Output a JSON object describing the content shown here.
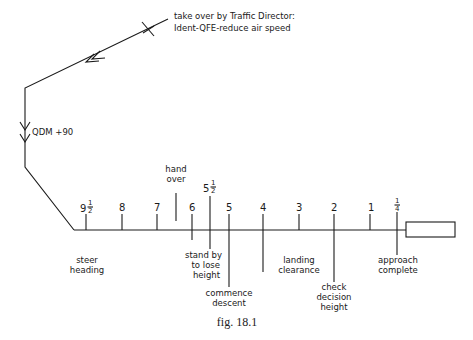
{
  "figure": {
    "caption": "fig. 18.1",
    "stroke_color": "#1a1a1a",
    "background": "#ffffff"
  },
  "path": {
    "takeover_note_line1": "take over by Traffic Director:",
    "takeover_note_line2": "Ident-QFE-reduce air speed",
    "heading_label": "QDM +90"
  },
  "ticks": [
    {
      "label": "9",
      "fraction": "1/2",
      "x": 86
    },
    {
      "label": "8",
      "x": 122
    },
    {
      "label": "7",
      "x": 157
    },
    {
      "label": "6",
      "x": 192
    },
    {
      "label": "5",
      "fraction": "1/2",
      "x": 210
    },
    {
      "label": "5",
      "x": 229
    },
    {
      "label": "4",
      "x": 263
    },
    {
      "label": "3",
      "x": 299
    },
    {
      "label": "2",
      "x": 334
    },
    {
      "label": "1",
      "x": 370
    },
    {
      "label": "",
      "fraction": "1/4",
      "x": 397
    }
  ],
  "annotations": {
    "hand_over_1": "hand",
    "hand_over_2": "over",
    "steer_heading_1": "steer",
    "steer_heading_2": "heading",
    "stand_by_1": "stand by",
    "stand_by_2": "to lose",
    "stand_by_3": "height",
    "commence_1": "commence",
    "commence_2": "descent",
    "landing_1": "landing",
    "landing_2": "clearance",
    "check_1": "check",
    "check_2": "decision",
    "check_3": "height",
    "approach_1": "approach",
    "approach_2": "complete"
  },
  "fractions": {
    "half_num": "1",
    "half_den": "2",
    "quarter_num": "1",
    "quarter_den": "4"
  }
}
